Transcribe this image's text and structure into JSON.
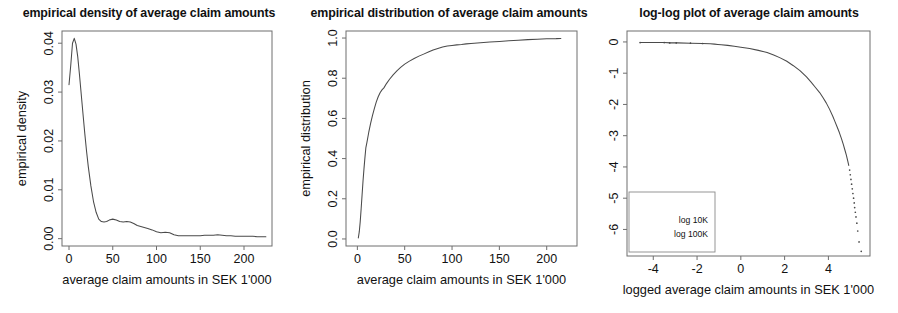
{
  "figure": {
    "background": "#ffffff",
    "ink_color": "#4a4a4a",
    "axis_color": "#6e6e6e"
  },
  "panels": [
    {
      "id": "empirical-density",
      "title": "empirical density of average claim amounts",
      "xlabel": "average claim amounts in SEK 1'000",
      "ylabel": "empirical density",
      "xticks": [
        "0",
        "50",
        "100",
        "150",
        "200"
      ],
      "yticks": [
        "0.00",
        "0.01",
        "0.02",
        "0.03",
        "0.04"
      ]
    },
    {
      "id": "empirical-distribution",
      "title": "empirical distribution of average claim amounts",
      "xlabel": "average claim amounts in SEK 1'000",
      "ylabel": "empirical distribution",
      "xticks": [
        "0",
        "50",
        "100",
        "150",
        "200"
      ],
      "yticks": [
        "0.0",
        "0.2",
        "0.4",
        "0.6",
        "0.8",
        "1.0"
      ]
    },
    {
      "id": "log-log-plot",
      "title": "log-log plot of average claim amounts",
      "xlabel": "logged average claim amounts in SEK 1'000",
      "ylabel": "logged survival probability",
      "xticks": [
        "-4",
        "-2",
        "0",
        "2",
        "4"
      ],
      "yticks": [
        "-6",
        "-5",
        "-4",
        "-3",
        "-2",
        "-1",
        "0"
      ],
      "legend": [
        "log 10K",
        "log 100K"
      ]
    }
  ],
  "chart_data": [
    {
      "type": "line",
      "title": "empirical density of average claim amounts",
      "xlabel": "average claim amounts in SEK 1'000",
      "ylabel": "empirical density",
      "xlim": [
        -8,
        232
      ],
      "ylim": [
        -0.0015,
        0.0425
      ],
      "xticks": [
        0,
        50,
        100,
        150,
        200
      ],
      "yticks": [
        0.0,
        0.01,
        0.02,
        0.03,
        0.04
      ],
      "grid": false,
      "legend": null,
      "x": [
        0,
        2,
        4,
        6,
        8,
        10,
        12,
        14,
        16,
        18,
        20,
        22,
        25,
        28,
        31,
        34,
        37,
        40,
        43,
        46,
        50,
        54,
        58,
        62,
        66,
        70,
        74,
        78,
        82,
        86,
        90,
        95,
        100,
        105,
        110,
        115,
        120,
        125,
        130,
        135,
        140,
        145,
        150,
        155,
        160,
        165,
        170,
        175,
        180,
        185,
        190,
        195,
        200,
        205,
        210,
        215,
        220,
        225
      ],
      "y": [
        0.0315,
        0.0355,
        0.04,
        0.041,
        0.0398,
        0.0372,
        0.0335,
        0.0295,
        0.0255,
        0.0216,
        0.018,
        0.0148,
        0.0108,
        0.0076,
        0.0054,
        0.004,
        0.0035,
        0.0034,
        0.0035,
        0.0038,
        0.004,
        0.0038,
        0.0035,
        0.0034,
        0.0035,
        0.0034,
        0.0031,
        0.0027,
        0.0025,
        0.0023,
        0.0021,
        0.0018,
        0.0014,
        0.0012,
        0.0013,
        0.0012,
        0.0008,
        0.0006,
        0.0006,
        0.0006,
        0.0006,
        0.0006,
        0.0006,
        0.0007,
        0.0007,
        0.0007,
        0.0008,
        0.0007,
        0.0006,
        0.0006,
        0.0005,
        0.0005,
        0.0005,
        0.0005,
        0.0005,
        0.0004,
        0.0004,
        0.0004
      ]
    },
    {
      "type": "line",
      "title": "empirical distribution of average claim amounts",
      "xlabel": "average claim amounts in SEK 1'000",
      "ylabel": "empirical distribution",
      "xlim": [
        -12,
        232
      ],
      "ylim": [
        -0.035,
        1.035
      ],
      "xticks": [
        0,
        50,
        100,
        150,
        200
      ],
      "yticks": [
        0.0,
        0.2,
        0.4,
        0.6,
        0.8,
        1.0
      ],
      "grid": false,
      "legend": null,
      "x": [
        1,
        2,
        3,
        4,
        5,
        6,
        7,
        8,
        9,
        10,
        12,
        14,
        16,
        18,
        20,
        22,
        24,
        26,
        28,
        30,
        34,
        38,
        42,
        46,
        50,
        55,
        60,
        65,
        70,
        75,
        80,
        85,
        90,
        95,
        100,
        105,
        110,
        115,
        120,
        130,
        140,
        150,
        160,
        170,
        180,
        190,
        200,
        210,
        215
      ],
      "y": [
        0.005,
        0.035,
        0.085,
        0.15,
        0.22,
        0.29,
        0.35,
        0.405,
        0.455,
        0.478,
        0.53,
        0.575,
        0.615,
        0.65,
        0.682,
        0.708,
        0.728,
        0.742,
        0.752,
        0.768,
        0.795,
        0.818,
        0.838,
        0.855,
        0.87,
        0.885,
        0.898,
        0.91,
        0.92,
        0.93,
        0.94,
        0.948,
        0.955,
        0.96,
        0.963,
        0.966,
        0.968,
        0.971,
        0.973,
        0.977,
        0.98,
        0.983,
        0.986,
        0.989,
        0.992,
        0.994,
        0.996,
        0.997,
        0.998
      ]
    },
    {
      "type": "scatter",
      "title": "log-log plot of average claim amounts",
      "xlabel": "logged average claim amounts in SEK 1'000",
      "ylabel": "logged survival probability",
      "xlim": [
        -5.2,
        5.9
      ],
      "ylim": [
        -6.85,
        0.35
      ],
      "xticks": [
        -4,
        -2,
        0,
        2,
        4
      ],
      "yticks": [
        -6,
        -5,
        -4,
        -3,
        -2,
        -1,
        0
      ],
      "grid": false,
      "legend": [
        "log 10K",
        "log 100K"
      ],
      "legend_position": "bottom-left",
      "x": [
        -4.6,
        -3.5,
        -3.2,
        -2.9,
        -2.3,
        -1.75,
        -1.4,
        -1.2,
        -1.05,
        -0.9,
        -0.6,
        -0.3,
        0.0,
        0.4,
        0.8,
        1.2,
        1.5,
        1.8,
        2.1,
        2.4,
        2.7,
        3.0,
        3.2,
        3.4,
        3.6,
        3.75,
        3.9,
        4.05,
        4.2,
        4.3,
        4.4,
        4.5,
        4.6,
        4.68,
        4.75,
        4.82,
        4.88,
        4.93,
        4.97,
        5.0,
        5.03,
        5.06,
        5.09,
        5.12,
        5.15,
        5.18,
        5.2,
        5.23,
        5.26,
        5.3,
        5.34,
        5.4,
        5.5
      ],
      "y": [
        -0.02,
        -0.02,
        -0.03,
        -0.03,
        -0.04,
        -0.05,
        -0.06,
        -0.07,
        -0.08,
        -0.09,
        -0.11,
        -0.14,
        -0.17,
        -0.21,
        -0.27,
        -0.34,
        -0.42,
        -0.51,
        -0.62,
        -0.76,
        -0.92,
        -1.12,
        -1.28,
        -1.45,
        -1.62,
        -1.78,
        -1.95,
        -2.15,
        -2.38,
        -2.55,
        -2.72,
        -2.9,
        -3.1,
        -3.28,
        -3.45,
        -3.62,
        -3.8,
        -3.95,
        -4.1,
        -4.25,
        -4.4,
        -4.55,
        -4.7,
        -4.85,
        -5.0,
        -5.15,
        -5.3,
        -5.45,
        -5.6,
        -5.8,
        -6.05,
        -6.4,
        -6.7
      ]
    }
  ]
}
